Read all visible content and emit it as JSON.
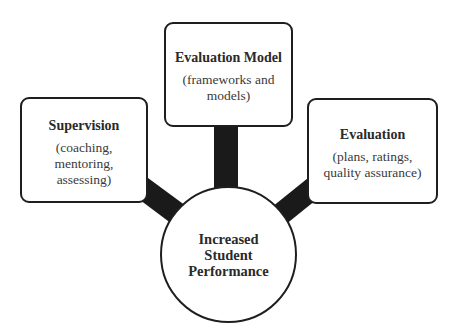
{
  "diagram": {
    "type": "hub-and-spoke",
    "colors": {
      "outline": "#1e1e1e",
      "connector": "#1a1a1a",
      "fill": "#ffffff",
      "text": "#2a2a2a"
    },
    "center": {
      "label": "Increased\nStudent\nPerformance"
    },
    "nodes": [
      {
        "id": "evaluation-model",
        "position": "top",
        "heading": "Evaluation Model",
        "description": "(frameworks and\nmodels)"
      },
      {
        "id": "supervision",
        "position": "left",
        "heading": "Supervision",
        "description": "(coaching,\nmentoring,\nassessing)"
      },
      {
        "id": "evaluation",
        "position": "right",
        "heading": "Evaluation",
        "description": "(plans, ratings,\nquality assurance)"
      }
    ],
    "edges": [
      {
        "from": "evaluation-model",
        "to": "center"
      },
      {
        "from": "supervision",
        "to": "center"
      },
      {
        "from": "evaluation",
        "to": "center"
      }
    ]
  }
}
